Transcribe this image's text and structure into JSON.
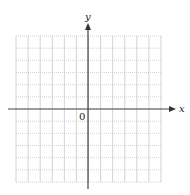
{
  "diagram": {
    "type": "coordinate-grid",
    "axes": {
      "x_label": "x",
      "y_label": "y",
      "origin_label": "0",
      "axis_color": "#333333"
    },
    "grid": {
      "columns": 12,
      "rows": 12,
      "x_range": [
        -6,
        6
      ],
      "y_range": [
        -6,
        6
      ],
      "grid_color": "#c8c8c8",
      "style": "dotted"
    }
  },
  "chart_data": {
    "type": "scatter",
    "title": "",
    "xlabel": "x",
    "ylabel": "y",
    "xlim": [
      -6,
      6
    ],
    "ylim": [
      -6,
      6
    ],
    "grid": true,
    "series": []
  }
}
